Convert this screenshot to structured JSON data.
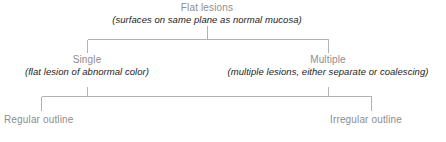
{
  "diagram": {
    "type": "flowchart",
    "orientation": "top-down",
    "line_color": "#b2b2b2",
    "heading_color": "#8d8d8d",
    "subtitle_color": "#1d1d1d",
    "background": "#ffffff",
    "root": {
      "heading": "Flat lesions",
      "subtitle": "(surfaces on same plane as normal mucosa)"
    },
    "branches": [
      {
        "heading": "Single",
        "subtitle": "(flat lesion of abnormal color)"
      },
      {
        "heading": "Multiple",
        "subtitle": "(multiple lesions, either separate or coalescing)"
      }
    ],
    "leaves": [
      {
        "label": "Regular outline"
      },
      {
        "label": "Irregular outline"
      }
    ]
  }
}
